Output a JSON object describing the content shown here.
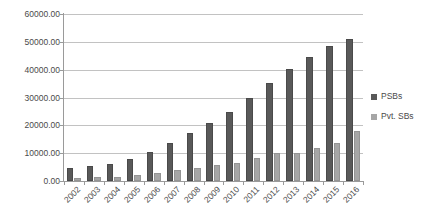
{
  "chart_data": {
    "type": "bar",
    "title": "",
    "xlabel": "",
    "ylabel": "",
    "ylim": [
      0,
      60000
    ],
    "ytick_step": 10000,
    "grid": true,
    "legend_position": "right",
    "categories": [
      "2002",
      "2003",
      "2004",
      "2005",
      "2006",
      "2007",
      "2008",
      "2009",
      "2010",
      "2011",
      "2012",
      "2013",
      "2014",
      "2015",
      "2016"
    ],
    "ytick_labels": [
      "60000.00",
      "50000.00",
      "40000.00",
      "30000.00",
      "20000.00",
      "10000.00",
      "0.00"
    ],
    "series": [
      {
        "name": "PSBs",
        "color": "#595959",
        "values": [
          4500,
          5400,
          6000,
          7900,
          10600,
          13700,
          17300,
          20900,
          24700,
          30000,
          35100,
          40300,
          44600,
          48600,
          51000
        ]
      },
      {
        "name": "Pvt. SBs",
        "color": "#a6a6a6",
        "values": [
          1200,
          1600,
          1600,
          2000,
          2900,
          3800,
          4600,
          5700,
          6400,
          8100,
          10100,
          10200,
          11900,
          13700,
          18000
        ]
      }
    ]
  },
  "legend": {
    "items": [
      {
        "label": "PSBs",
        "color": "#595959"
      },
      {
        "label": "Pvt. SBs",
        "color": "#a6a6a6"
      }
    ]
  }
}
